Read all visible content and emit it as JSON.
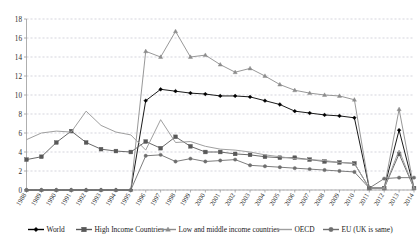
{
  "chart_data": {
    "type": "line",
    "title": "",
    "subtitle": "",
    "xlabel": "",
    "ylabel": "",
    "xlim": [
      1988,
      2014
    ],
    "ylim": [
      0,
      18
    ],
    "ytick_step": 2,
    "yticks": [
      0,
      2,
      4,
      6,
      8,
      10,
      12,
      14,
      16,
      18
    ],
    "grid": true,
    "legend_position": "bottom",
    "categories": [
      "1988",
      "1989",
      "1990",
      "1991",
      "1992",
      "1993",
      "1994",
      "1995",
      "1996",
      "1997",
      "1998",
      "1999",
      "2000",
      "2001",
      "2002",
      "2003",
      "2004",
      "2005",
      "2006",
      "2007",
      "2008",
      "2009",
      "2010",
      "2011",
      "2012",
      "2013",
      "2014"
    ],
    "series": [
      {
        "name": "World",
        "color": "#000000",
        "marker": "diamond",
        "values": [
          0,
          0,
          0,
          0,
          0,
          0,
          0,
          0,
          9.4,
          10.6,
          10.4,
          10.2,
          10.1,
          9.9,
          9.9,
          9.8,
          9.4,
          9.0,
          8.3,
          8.1,
          7.9,
          7.8,
          7.6,
          0.2,
          0.2,
          6.3,
          0.2
        ]
      },
      {
        "name": "High Income Countries",
        "color": "#585858",
        "marker": "square",
        "values": [
          3.2,
          3.5,
          5.0,
          6.2,
          5.0,
          4.3,
          4.1,
          4.0,
          5.1,
          4.4,
          5.6,
          4.6,
          4.0,
          4.0,
          3.8,
          3.7,
          3.5,
          3.4,
          3.4,
          3.2,
          3.0,
          2.9,
          2.8,
          0.2,
          0.2,
          3.8,
          0.2
        ]
      },
      {
        "name": "Low and middle income countries",
        "color": "#8c8c8c",
        "marker": "triangle",
        "values": [
          0,
          0,
          0,
          0,
          0,
          0,
          0,
          0,
          14.6,
          14.0,
          16.7,
          14.0,
          14.2,
          13.2,
          12.4,
          12.8,
          12.0,
          11.1,
          10.5,
          10.2,
          10.0,
          9.9,
          9.5,
          0.2,
          0.2,
          8.5,
          0.2
        ]
      },
      {
        "name": "OECD",
        "color": "#9f9f9f",
        "marker": "none",
        "values": [
          5.3,
          6.0,
          6.2,
          6.1,
          8.3,
          6.8,
          6.1,
          5.8,
          4.2,
          7.4,
          5.0,
          5.1,
          4.6,
          4.3,
          4.2,
          4.0,
          3.7,
          3.5,
          3.3,
          3.2,
          3.1,
          2.9,
          2.8,
          0.2,
          0.2,
          4.2,
          0.2
        ]
      },
      {
        "name": "EU (UK is same)",
        "color": "#6e6e6e",
        "marker": "circle",
        "values": [
          0,
          0,
          0,
          0,
          0,
          0,
          0,
          0,
          3.6,
          3.7,
          3.0,
          3.3,
          3.0,
          3.1,
          3.2,
          2.6,
          2.5,
          2.4,
          2.3,
          2.2,
          2.1,
          2.0,
          1.9,
          0.2,
          1.2,
          1.3,
          1.3
        ]
      }
    ]
  },
  "legend": {
    "items": [
      {
        "label": "World"
      },
      {
        "label": "High Income Countries"
      },
      {
        "label": "Low and middle income countries"
      },
      {
        "label": "OECD"
      },
      {
        "label": "EU (UK is same)"
      }
    ]
  }
}
